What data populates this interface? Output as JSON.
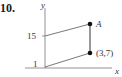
{
  "problem": {
    "number": "10."
  },
  "axes": {
    "x_label": "x",
    "y_label": "y"
  },
  "ticks": {
    "y_upper": "15",
    "y_lower": "1"
  },
  "points": {
    "a": {
      "label": "A"
    },
    "b": {
      "label": "(3,7)"
    }
  },
  "colors": {
    "line": "#555555",
    "point": "#111111",
    "text": "#333333"
  }
}
